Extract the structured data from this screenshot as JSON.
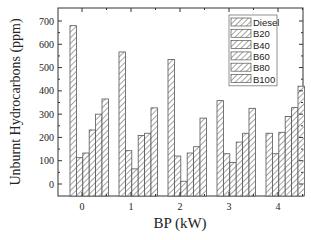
{
  "chart_data": {
    "type": "bar",
    "title": "",
    "xlabel": "BP (kW)",
    "ylabel": "Unburnt Hydrocarbons (ppm)",
    "categories": [
      "0",
      "1",
      "2",
      "3",
      "4"
    ],
    "series": [
      {
        "name": "Diesel",
        "values": [
          680,
          567,
          535,
          358,
          218
        ]
      },
      {
        "name": "B20",
        "values": [
          113,
          143,
          120,
          130,
          130
        ]
      },
      {
        "name": "B40",
        "values": [
          133,
          65,
          12,
          93,
          222
        ]
      },
      {
        "name": "B60",
        "values": [
          232,
          208,
          133,
          180,
          290
        ]
      },
      {
        "name": "B80",
        "values": [
          300,
          218,
          160,
          218,
          328
        ]
      },
      {
        "name": "B100",
        "values": [
          365,
          327,
          283,
          325,
          420
        ]
      }
    ],
    "ylim": [
      -50,
      750
    ],
    "yticks": [
      0,
      100,
      200,
      300,
      400,
      500,
      600,
      700
    ],
    "grid": false,
    "legend_position": "upper right",
    "bar_fill": "hatched (diagonal)"
  },
  "colors": {
    "bar_stroke": "#555555",
    "hatch": "#666666",
    "axis": "#333333",
    "text": "#222222"
  }
}
